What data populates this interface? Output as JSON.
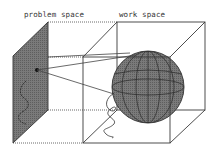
{
  "labels": {
    "problem_space": "problem space",
    "work_space": "work space"
  },
  "colors": {
    "line": "#3a3a3a",
    "panel_fill": "#6e6e6e",
    "sphere_fill": "#7a7a7a",
    "background": "#ffffff"
  },
  "elements": {
    "problem_space_panel": "shaded plane with a point and curve",
    "work_space_cube": "wireframe cube",
    "sphere": "shaded sphere with latitude/longitude lines",
    "mapping_lines": "two lines from point in problem space to sphere",
    "trajectory_curve": "wavy curve below sphere"
  }
}
